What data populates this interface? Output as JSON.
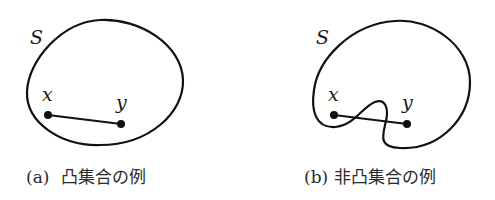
{
  "figure": {
    "panels": [
      {
        "id": "a",
        "set_label": "S",
        "point_labels": [
          "x",
          "y"
        ],
        "caption_tag": "(a)",
        "caption_text": "凸集合の例",
        "description": "convex set: segment xy lies inside S"
      },
      {
        "id": "b",
        "set_label": "S",
        "point_labels": [
          "x",
          "y"
        ],
        "caption_tag": "(b)",
        "caption_text": "非凸集合の例",
        "description": "non-convex set: segment xy exits S"
      }
    ],
    "colors": {
      "stroke": "#111111",
      "text": "#2a2a2a",
      "background": "#ffffff"
    }
  }
}
